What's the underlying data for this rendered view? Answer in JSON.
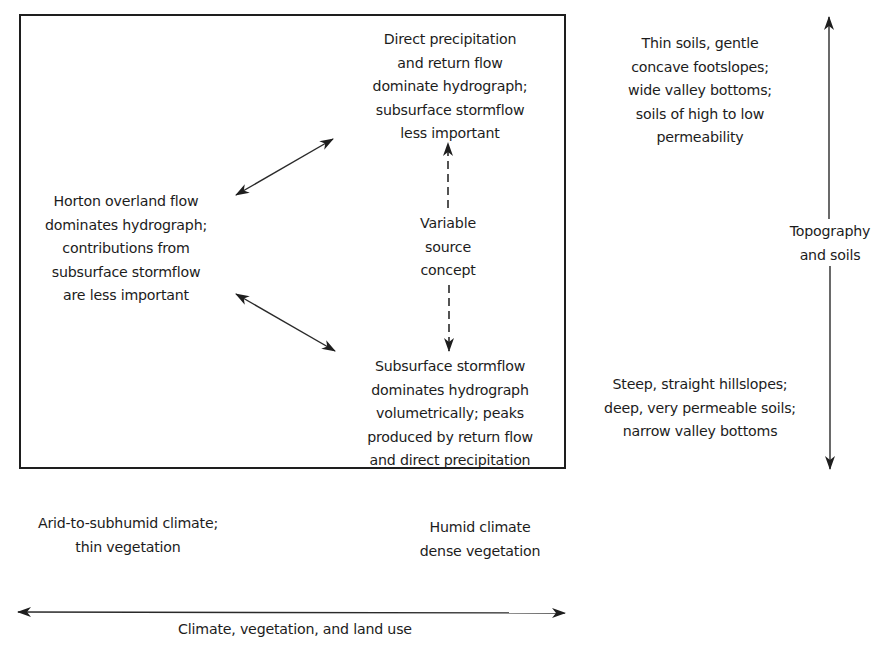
{
  "diagram": {
    "box": {
      "top_node": {
        "lines": [
          "Direct precipitation",
          "and return flow",
          "dominate hydrograph;",
          "subsurface stormflow",
          "less important"
        ]
      },
      "left_node": {
        "lines": [
          "Horton overland flow",
          "dominates hydrograph;",
          "contributions from",
          "subsurface stormflow",
          "are less important"
        ]
      },
      "center_label": {
        "lines": [
          "Variable",
          "source",
          "concept"
        ]
      },
      "bottom_node": {
        "lines": [
          "Subsurface stormflow",
          "dominates hydrograph",
          "volumetrically; peaks",
          "produced by return flow",
          "and direct precipitation"
        ]
      }
    },
    "vertical_axis": {
      "label_lines": [
        "Topography",
        "and soils"
      ],
      "top_end": {
        "lines": [
          "Thin soils, gentle",
          "concave footslopes;",
          "wide valley bottoms;",
          "soils of high to low",
          "permeability"
        ]
      },
      "bottom_end": {
        "lines": [
          "Steep, straight hillslopes;",
          "deep, very permeable soils;",
          "narrow valley bottoms"
        ]
      }
    },
    "horizontal_axis": {
      "label": "Climate, vegetation, and land use",
      "left_end": {
        "lines": [
          "Arid-to-subhumid climate;",
          "thin vegetation"
        ]
      },
      "right_end": {
        "lines": [
          "Humid climate",
          "dense vegetation"
        ]
      }
    },
    "colors": {
      "ink": "#1c1c1c",
      "background": "#ffffff"
    }
  }
}
